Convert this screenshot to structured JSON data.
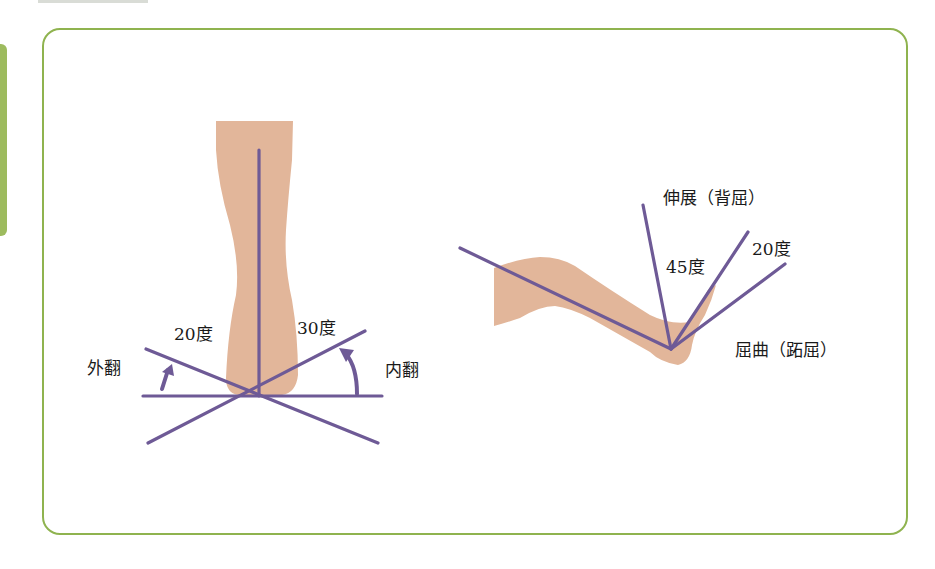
{
  "colors": {
    "frame": "#8fb34f",
    "side_tab": "#9dbb5e",
    "skin": "#e2b69a",
    "line": "#6e5a96"
  },
  "ankle_inversion_eversion": {
    "labels": {
      "eversion": "外翻",
      "inversion": "内翻",
      "eversion_angle": "20度",
      "inversion_angle": "30度"
    }
  },
  "ankle_dorsiflexion_plantarflexion": {
    "labels": {
      "extension": "伸展（背屈）",
      "flexion": "屈曲（跖屈）",
      "extension_angle": "45度",
      "flexion_angle": "20度"
    }
  }
}
